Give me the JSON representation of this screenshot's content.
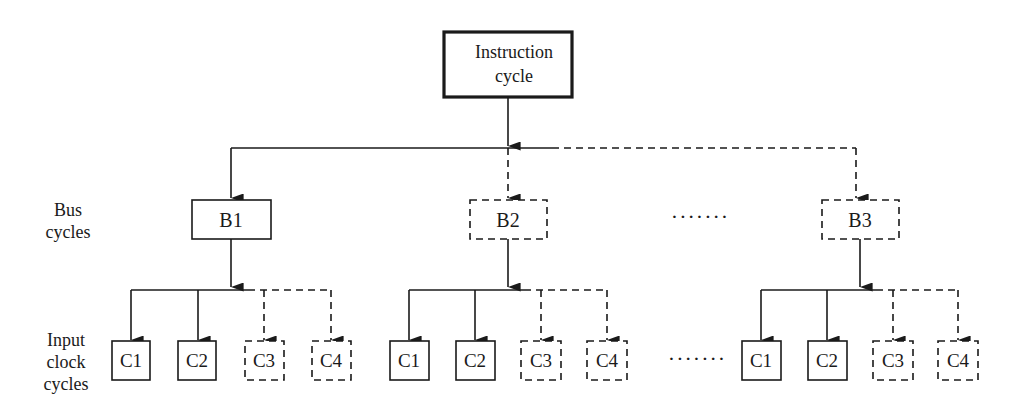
{
  "diagram": {
    "root": {
      "label_line1": "Instruction",
      "label_line2": "cycle"
    },
    "row_labels": {
      "bus": {
        "line1": "Bus",
        "line2": "cycles"
      },
      "clock": {
        "line1": "Input",
        "line2": "clock",
        "line3": "cycles"
      }
    },
    "bus_cycles": [
      {
        "label": "B1",
        "style": "solid"
      },
      {
        "label": "B2",
        "style": "dashed"
      },
      {
        "label": "B3",
        "style": "dashed"
      }
    ],
    "clock_cycles": [
      {
        "label": "C1",
        "style": "solid"
      },
      {
        "label": "C2",
        "style": "solid"
      },
      {
        "label": "C3",
        "style": "dashed"
      },
      {
        "label": "C4",
        "style": "dashed"
      }
    ],
    "ellipsis": "·······",
    "colors": {
      "stroke": "#1a1a1a",
      "background": "#ffffff"
    }
  }
}
